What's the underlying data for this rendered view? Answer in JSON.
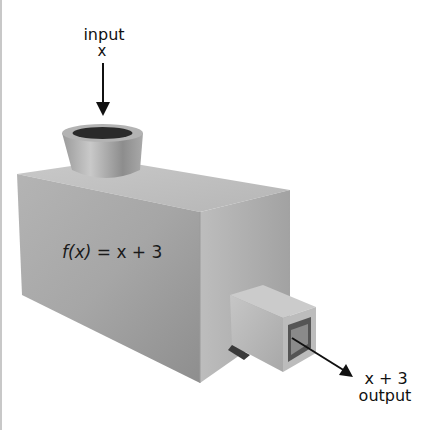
{
  "diagram": {
    "input_label": "input",
    "input_var": "x",
    "function_label": "f(x) = x + 3",
    "function_name": "f",
    "function_arg": "(x)",
    "function_rhs": " = x + 3",
    "output_expr": "x + 3",
    "output_label": "output"
  },
  "colors": {
    "background": "#ffffff",
    "box_front": "#a9a9a9",
    "box_side": "#b9b9b9",
    "box_top": "#c4c4c4",
    "arrow": "#111111"
  }
}
